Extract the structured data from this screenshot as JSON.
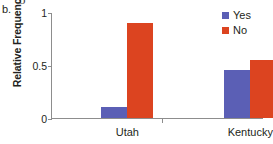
{
  "figure": {
    "panel_label": "b.",
    "top_bleed_glyph": "o"
  },
  "legend": {
    "position": "top-right",
    "items": [
      {
        "label": "Yes",
        "color": "#5b5fb5",
        "swatch_icon": "square-swatch-icon"
      },
      {
        "label": "No",
        "color": "#dc4420",
        "swatch_icon": "square-swatch-icon"
      }
    ]
  },
  "chart_data": {
    "type": "bar",
    "title": "",
    "subtitle": "",
    "xlabel": "",
    "ylabel": "Relative Frequency",
    "categories": [
      "Utah",
      "Kentucky"
    ],
    "series": [
      {
        "name": "Yes",
        "color": "#5b5fb5",
        "values": [
          0.1,
          0.45
        ]
      },
      {
        "name": "No",
        "color": "#dc4420",
        "values": [
          0.9,
          0.55
        ]
      }
    ],
    "ylim": [
      0,
      1
    ],
    "yticks": [
      0,
      0.5,
      1
    ],
    "ytick_labels": [
      "0",
      "0.5",
      "1"
    ],
    "grid": false,
    "legend_position": "top-right",
    "orientation": "vertical",
    "grouped": true
  },
  "geometry": {
    "plot_width": 212,
    "plot_height": 106,
    "group_centers_pct": [
      36.0,
      94.0
    ],
    "bar_width_px": 26,
    "bar_gap_px": 0,
    "category_tick_pct": [
      52.5
    ]
  }
}
